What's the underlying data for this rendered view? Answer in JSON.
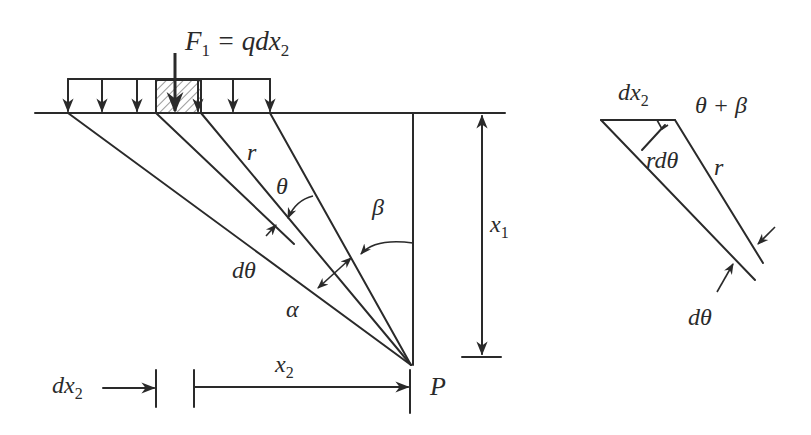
{
  "figure": {
    "type": "stress-under-strip-load-diagram",
    "main": {
      "load_label": {
        "F": "F",
        "sub": "1",
        "eq": " = qdx",
        "sub2": "2"
      },
      "r_label": "r",
      "theta_label": "θ",
      "beta_label": "β",
      "dtheta_label": "dθ",
      "alpha_label": "α",
      "x1_label": {
        "x": "x",
        "sub": "1"
      },
      "x2_label": {
        "x": "x",
        "sub": "2"
      },
      "dx2_label": {
        "d": "dx",
        "sub": "2"
      },
      "p_label": "P"
    },
    "detail": {
      "dx2_label": {
        "d": "dx",
        "sub": "2"
      },
      "theta_beta_label": "θ + β",
      "rdtheta_label": "rdθ",
      "r_label": "r",
      "dtheta_label": "dθ"
    },
    "colors": {
      "ink": "#2a2a2a",
      "background": "#ffffff"
    }
  }
}
